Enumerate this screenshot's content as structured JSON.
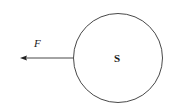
{
  "diagram": {
    "circle_label": "S",
    "force_label": "F",
    "circle": {
      "cx": 118,
      "cy": 58,
      "r": 45,
      "stroke": "#333333"
    },
    "arrow": {
      "x1": 73,
      "y1": 58,
      "x2": 20,
      "y2": 58,
      "direction": "left",
      "color": "#333333"
    }
  }
}
